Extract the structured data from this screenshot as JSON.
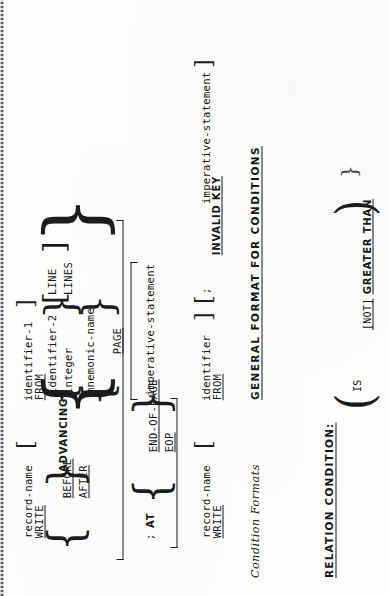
{
  "document": {
    "kind": "scanned-manual-page",
    "orientation_note": "rotated-90-ccw",
    "background_color": "#fdfdfc",
    "ink_color": "#171717"
  },
  "write_format_1": {
    "line1": {
      "keyword": "WRITE",
      "operand": "record-name",
      "optional_from": "FROM",
      "optional_from_operand": "identifier-1",
      "full": "WRITE record-name [ FROM identifier-1 ]"
    },
    "advancing_clause": {
      "before": "BEFORE",
      "after": "AFTER",
      "keyword": "ADVANCING",
      "choice_a_upper": "identifier-2",
      "choice_a_lower": "integer",
      "line_singular": "LINE",
      "line_plural": "LINES",
      "choice_b_upper": "mnemonic-name",
      "choice_b_lower": "PAGE"
    },
    "at_clause": {
      "separator": ";",
      "keyword": "AT",
      "option_upper": "END-OF-PAGE",
      "option_lower": "EOP",
      "action": "imperative-statement"
    }
  },
  "write_format_2": {
    "line1": {
      "keyword": "WRITE",
      "operand": "record-name",
      "optional_from": "FROM",
      "optional_from_operand": "identifier",
      "full": "WRITE record-name [ FROM identifier ]"
    },
    "invalid_key_clause": {
      "separator": ";",
      "keyword": "INVALID KEY",
      "action": "imperative-statement",
      "full": "[ ; INVALID KEY imperative-statement ]"
    }
  },
  "section_conditions": {
    "caption": "Condition Formats",
    "heading": "GENERAL FORMAT FOR CONDITIONS",
    "subheading": "RELATION CONDITION:",
    "relational_operator": {
      "is": "IS",
      "not_optional": "[NOT]",
      "operator": "GREATER THAN"
    }
  }
}
